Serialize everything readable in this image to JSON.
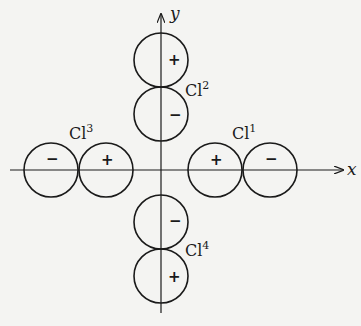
{
  "diagram": {
    "colors": {
      "ink": "#1a1a1a",
      "background": "#f4f4f2"
    },
    "axes": {
      "x_label": "x",
      "y_label": "y"
    },
    "ligands": [
      {
        "name": "Cl",
        "superscript": "1",
        "position": "+x",
        "inner_lobe_sign": "+",
        "outer_lobe_sign": "−"
      },
      {
        "name": "Cl",
        "superscript": "2",
        "position": "+y",
        "inner_lobe_sign": "−",
        "outer_lobe_sign": "+"
      },
      {
        "name": "Cl",
        "superscript": "3",
        "position": "−x",
        "inner_lobe_sign": "+",
        "outer_lobe_sign": "−"
      },
      {
        "name": "Cl",
        "superscript": "4",
        "position": "−y",
        "inner_lobe_sign": "−",
        "outer_lobe_sign": "+"
      }
    ],
    "caption_partial": ""
  }
}
